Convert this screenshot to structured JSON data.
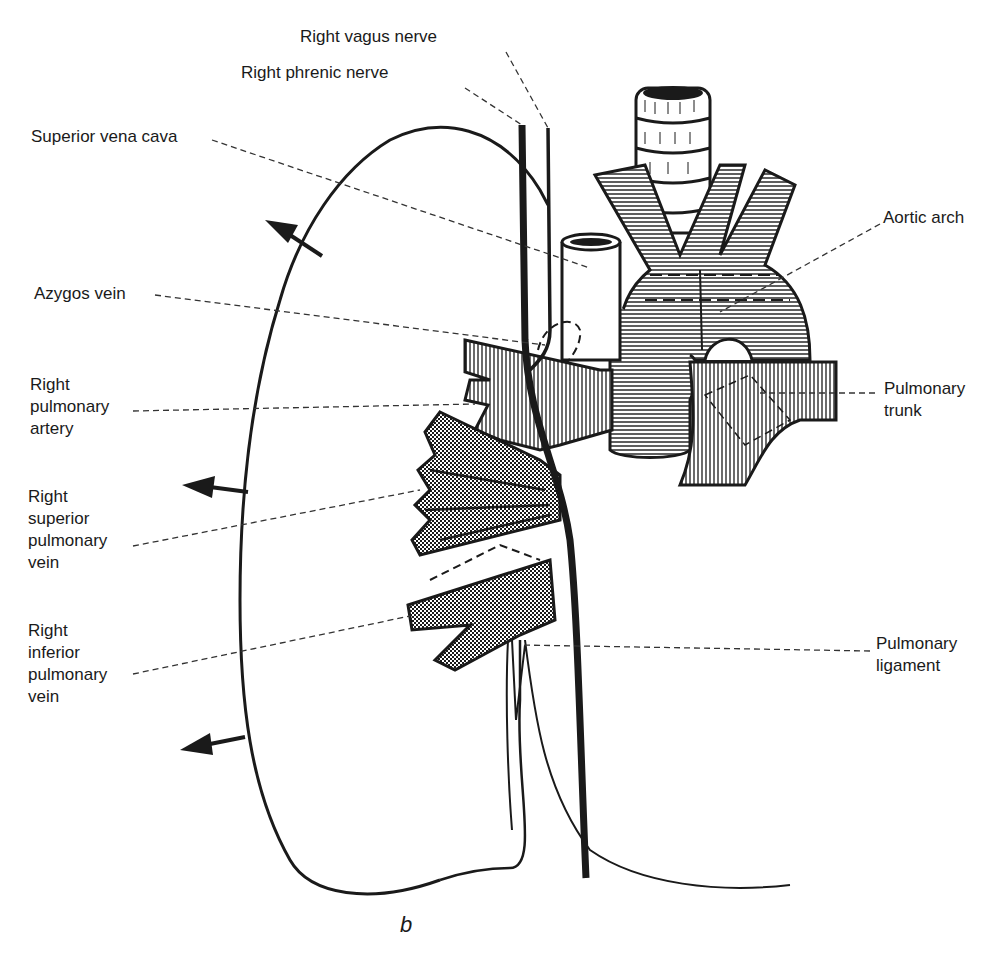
{
  "figure": {
    "panel_letter": "b",
    "colors": {
      "ink": "#1a1a1a",
      "background": "#ffffff",
      "leader": "#333333"
    }
  },
  "labels": {
    "right_vagus_nerve": "Right vagus nerve",
    "right_phrenic_nerve": "Right phrenic nerve",
    "superior_vena_cava": "Superior vena cava",
    "aortic_arch": "Aortic arch",
    "azygos_vein": "Azygos vein",
    "right_pulmonary_artery": "Right\npulmonary\nartery",
    "pulmonary_trunk": "Pulmonary\ntrunk",
    "right_superior_pulmonary_vein": "Right\nsuperior\npulmonary\nvein",
    "right_inferior_pulmonary_vein": "Right\ninferior\npulmonary\nvein",
    "pulmonary_ligament": "Pulmonary\nligament"
  },
  "arrows": [
    {
      "name": "retraction-arrow-upper",
      "direction": "up-left"
    },
    {
      "name": "retraction-arrow-middle",
      "direction": "left"
    },
    {
      "name": "retraction-arrow-lower",
      "direction": "left"
    }
  ]
}
